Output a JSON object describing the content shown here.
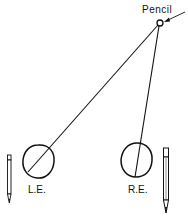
{
  "diagram": {
    "labels": {
      "pencil": "Pencil",
      "left_eye": "L.E.",
      "right_eye": "R.E."
    },
    "colors": {
      "stroke": "#111111",
      "background": "#ffffff"
    }
  }
}
